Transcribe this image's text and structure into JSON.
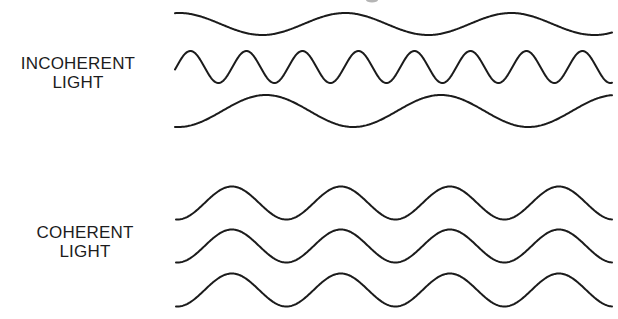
{
  "diagram": {
    "type": "wave comparison",
    "groups": [
      {
        "id": "incoherent",
        "label_lines": [
          "INCOHERENT",
          "LIGHT"
        ],
        "description": "Three waves of differing wavelength and phase",
        "waves": [
          {
            "x_start": 175,
            "x_end": 612,
            "y_center": 24,
            "amplitude": 11,
            "wavelength": 166,
            "phase_start": "near-peak descending"
          },
          {
            "x_start": 175,
            "x_end": 612,
            "y_center": 67,
            "amplitude": 16,
            "wavelength": 56,
            "phase_start": "mid rising"
          },
          {
            "x_start": 175,
            "x_end": 612,
            "y_center": 111,
            "amplitude": 16,
            "wavelength": 175,
            "phase_start": "trough rising"
          }
        ]
      },
      {
        "id": "coherent",
        "label_lines": [
          "COHERENT",
          "LIGHT"
        ],
        "description": "Three identical in-phase waves",
        "waves": [
          {
            "x_start": 176,
            "x_end": 612,
            "y_center": 203,
            "amplitude": 16.5,
            "wavelength": 109,
            "phase_start": "trough rising"
          },
          {
            "x_start": 176,
            "x_end": 612,
            "y_center": 246,
            "amplitude": 16.5,
            "wavelength": 109,
            "phase_start": "trough rising"
          },
          {
            "x_start": 176,
            "x_end": 612,
            "y_center": 290,
            "amplitude": 16.5,
            "wavelength": 109,
            "phase_start": "trough rising"
          }
        ]
      }
    ],
    "stroke_color": "#1b1b1b",
    "background": "#ffffff"
  },
  "labels": {
    "incoherent": {
      "line1": "INCOHERENT",
      "line2": "LIGHT"
    },
    "coherent": {
      "line1": "COHERENT",
      "line2": "LIGHT"
    }
  }
}
